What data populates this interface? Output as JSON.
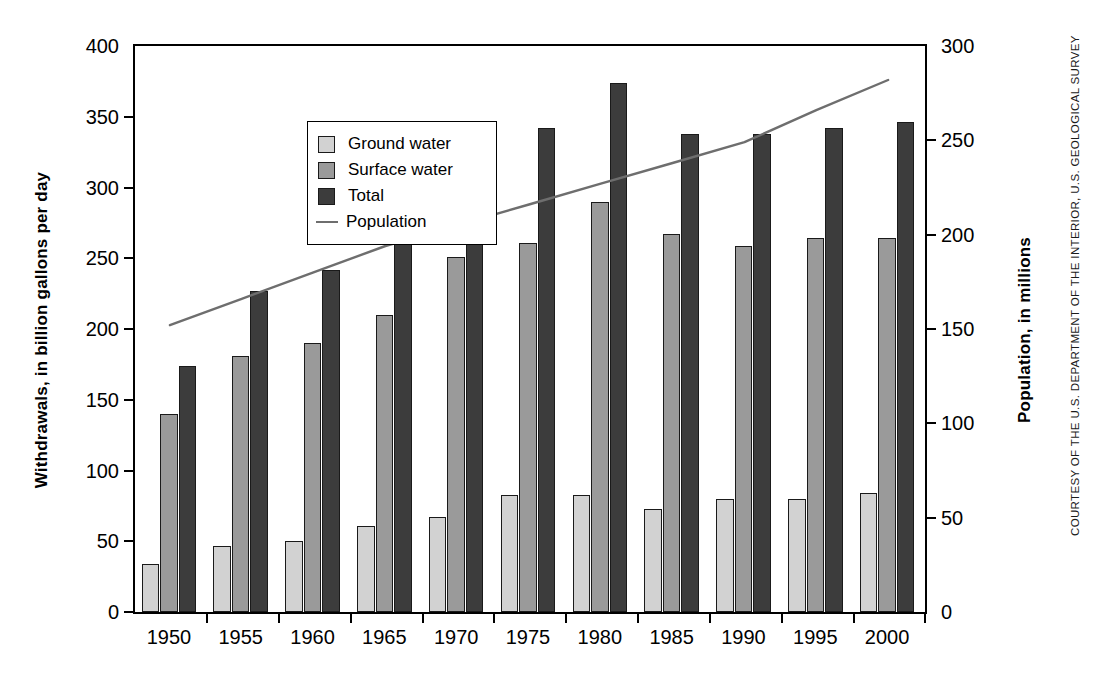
{
  "chart_data": {
    "type": "bar",
    "title": "",
    "subtitle": "",
    "categories": [
      "1950",
      "1955",
      "1960",
      "1965",
      "1970",
      "1975",
      "1980",
      "1985",
      "1990",
      "1995",
      "2000"
    ],
    "series": [
      {
        "name": "Ground water",
        "values": [
          34,
          47,
          50,
          61,
          67,
          83,
          83,
          73,
          80,
          80,
          84
        ],
        "color": "#d2d2d2",
        "axis": "left"
      },
      {
        "name": "Surface water",
        "values": [
          140,
          181,
          190,
          210,
          251,
          261,
          290,
          267,
          259,
          264,
          264
        ],
        "color": "#9a9a9a",
        "axis": "left"
      },
      {
        "name": "Total",
        "values": [
          174,
          227,
          242,
          271,
          319,
          342,
          374,
          338,
          338,
          342,
          346
        ],
        "color": "#3c3c3c",
        "axis": "left"
      },
      {
        "name": "Population",
        "values": [
          152,
          166,
          180,
          194,
          205,
          216,
          227,
          238,
          249,
          266,
          282
        ],
        "color": "#6e6e6e",
        "axis": "right",
        "render": "line"
      }
    ],
    "xlabel": "",
    "ylabel": "Withdrawals, in billion gallons per day",
    "y2label": "Population, in millions",
    "ylim": [
      0,
      400
    ],
    "y2lim": [
      0,
      300
    ],
    "yticks": [
      0,
      50,
      100,
      150,
      200,
      250,
      300,
      350,
      400
    ],
    "y2ticks": [
      0,
      50,
      100,
      150,
      200,
      250,
      300
    ],
    "grid": false,
    "legend_position": "upper-left",
    "legend_entries": [
      "Ground water",
      "Surface water",
      "Total",
      "Population"
    ]
  },
  "axes": {
    "left_title": "Withdrawals, in billion gallons per day",
    "right_title": "Population, in millions",
    "left_ticks": [
      "400",
      "350",
      "300",
      "250",
      "200",
      "150",
      "100",
      "50",
      "0"
    ],
    "right_ticks": [
      "300",
      "250",
      "200",
      "150",
      "100",
      "50",
      "0"
    ],
    "x_ticks": [
      "1950",
      "1955",
      "1960",
      "1965",
      "1970",
      "1975",
      "1980",
      "1985",
      "1990",
      "1995",
      "2000"
    ]
  },
  "legend": {
    "items": [
      {
        "label": "Ground water",
        "type": "swatch",
        "color": "#d2d2d2"
      },
      {
        "label": "Surface water",
        "type": "swatch",
        "color": "#9a9a9a"
      },
      {
        "label": "Total",
        "type": "swatch",
        "color": "#3c3c3c"
      },
      {
        "label": "Population",
        "type": "line",
        "color": "#6e6e6e"
      }
    ]
  },
  "credit": {
    "text": "COURTESY OF THE U.S. DEPARTMENT OF THE INTERIOR, U.S. GEOLOGICAL SURVEY"
  }
}
